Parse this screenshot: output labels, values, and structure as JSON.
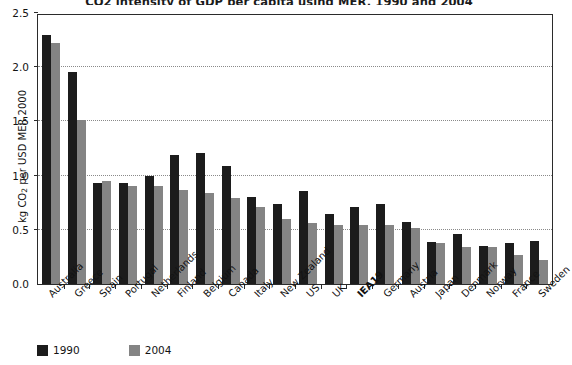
{
  "title": "CO2 intensity of GDP per capita using MER, 1990 and 2004",
  "axis": {
    "ylabel_main": "kg CO",
    "ylabel_sub": "2",
    "ylabel_tail": " per USD MER 2000",
    "yticks": [
      "0.0",
      "0.5",
      "1.0",
      "1.5",
      "2.0",
      "2.5"
    ]
  },
  "legend": [
    {
      "label": "1990",
      "color": "#1c1c1c",
      "swatch_name": "legend-swatch-1990"
    },
    {
      "label": "2004",
      "color": "#848484",
      "swatch_name": "legend-swatch-2004"
    }
  ],
  "chart_data": {
    "type": "bar",
    "title": "CO2 intensity of GDP per capita using MER, 1990 and 2004",
    "xlabel": "",
    "ylabel": "kg CO2 per USD MER 2000",
    "ylim": [
      0.0,
      2.5
    ],
    "ytick_step": 0.5,
    "grid": true,
    "legend_position": "bottom-left",
    "categories": [
      "Australia",
      "Greece",
      "Spain",
      "Portugal",
      "Netherlands",
      "Finland",
      "Belgium",
      "Canada",
      "Italy",
      "New Zealand",
      "US",
      "UK",
      "IEA19",
      "Germany",
      "Austria",
      "Japan",
      "Denmark",
      "Norway",
      "France",
      "Sweden"
    ],
    "highlight_category": "IEA19",
    "series": [
      {
        "name": "1990",
        "color": "#1c1c1c",
        "values": [
          2.3,
          1.96,
          0.93,
          0.93,
          1.0,
          1.19,
          1.21,
          1.09,
          0.8,
          0.74,
          0.86,
          0.65,
          0.71,
          0.74,
          0.57,
          0.39,
          0.46,
          0.35,
          0.38,
          0.4
        ]
      },
      {
        "name": "2004",
        "color": "#848484",
        "values": [
          2.22,
          1.51,
          0.95,
          0.9,
          0.9,
          0.87,
          0.84,
          0.79,
          0.71,
          0.6,
          0.56,
          0.54,
          0.54,
          0.54,
          0.52,
          0.38,
          0.34,
          0.34,
          0.27,
          0.22
        ]
      }
    ]
  }
}
